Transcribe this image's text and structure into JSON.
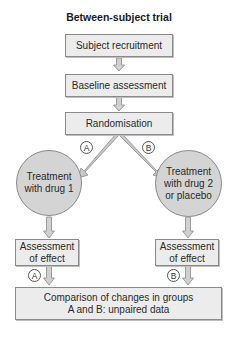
{
  "title": "Between-subject trial",
  "steps": {
    "recruitment": "Subject recruitment",
    "baseline": "Baseline assessment",
    "randomisation": "Randomisation",
    "treatment_a": "Treatment\nwith drug 1",
    "treatment_b": "Treatment\nwith drug 2\nor placebo",
    "assessment_a": "Assessment\nof effect",
    "assessment_b": "Assessment\nof effect",
    "comparison": "Comparison of changes in groups\nA and B: unpaired data"
  },
  "group_labels": {
    "a_top": "A",
    "b_top": "B",
    "a_bottom": "A",
    "b_bottom": "B"
  },
  "colors": {
    "box_fill": "#ececec",
    "circle_fill": "#d4d4d4",
    "arrow_fill": "#c8c8c8",
    "border": "#8a8a8a"
  }
}
